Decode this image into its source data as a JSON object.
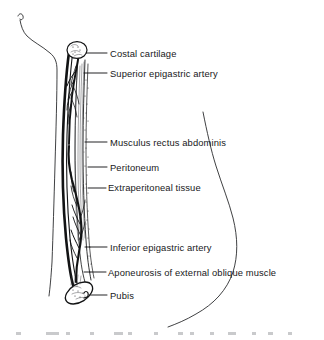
{
  "figure": {
    "kind": "anatomical-illustration",
    "orientation": "left body contour at left, abdominal profile contour at right",
    "background_color": "#ffffff",
    "ink_color": "#17181a"
  },
  "labels": [
    {
      "id": "costal-cartilage",
      "text": "Costal cartilage",
      "text_x": 110,
      "text_y": 57,
      "leader_from_x": 86,
      "leader_from_y": 53,
      "leader_to_x": 107,
      "leader_to_y": 53
    },
    {
      "id": "superior-epigastric-artery",
      "text": "Superior epigastric artery",
      "text_x": 110,
      "text_y": 77,
      "leader_from_x": 84,
      "leader_from_y": 73,
      "leader_to_x": 107,
      "leader_to_y": 73
    },
    {
      "id": "musculus-rectus-abdominis",
      "text": "Musculus rectus abdominis",
      "text_x": 110,
      "text_y": 146,
      "leader_from_x": 85,
      "leader_from_y": 142,
      "leader_to_x": 107,
      "leader_to_y": 142
    },
    {
      "id": "peritoneum",
      "text": "Peritoneum",
      "text_x": 110,
      "text_y": 171,
      "leader_from_x": 88,
      "leader_from_y": 167,
      "leader_to_x": 107,
      "leader_to_y": 167
    },
    {
      "id": "extraperitoneal-tissue",
      "text": "Extraperitoneal tissue",
      "text_x": 108,
      "text_y": 191,
      "leader_from_x": 88,
      "leader_from_y": 188,
      "leader_to_x": 106,
      "leader_to_y": 188
    },
    {
      "id": "inferior-epigastric-artery",
      "text": "Inferior epigastric artery",
      "text_x": 110,
      "text_y": 251,
      "leader_from_x": 85,
      "leader_from_y": 247,
      "leader_to_x": 107,
      "leader_to_y": 247
    },
    {
      "id": "aponeurosis-of-external-oblique-muscle",
      "text": "Aponeurosis of external oblique muscle",
      "text_x": 108,
      "text_y": 276,
      "leader_from_x": 84,
      "leader_from_y": 272,
      "leader_to_x": 106,
      "leader_to_y": 272
    },
    {
      "id": "pubis",
      "text": "Pubis",
      "text_x": 110,
      "text_y": 299,
      "leader_from_x": 90,
      "leader_from_y": 295,
      "leader_to_x": 107,
      "leader_to_y": 295
    }
  ],
  "structures": [
    {
      "id": "costal-cartilage-section",
      "shape": "ellipse",
      "cx": 77,
      "cy": 50,
      "rx": 10,
      "ry": 8
    },
    {
      "id": "pubis-section",
      "shape": "ellipse",
      "cx": 79,
      "cy": 293,
      "rx": 15,
      "ry": 9,
      "rotation": -32
    },
    {
      "id": "rectus-abdominis-band",
      "shape": "striated-column"
    },
    {
      "id": "superior-epigastric-artery-vessel",
      "shape": "descending-branching-vessel"
    },
    {
      "id": "inferior-epigastric-artery-vessel",
      "shape": "ascending-branching-vessel"
    },
    {
      "id": "peritoneum-line",
      "shape": "thin-inner-line"
    },
    {
      "id": "extraperitoneal-tissue-layer",
      "shape": "stippled-layer"
    },
    {
      "id": "external-oblique-aponeurosis-line",
      "shape": "thick-outer-line"
    },
    {
      "id": "left-body-contour",
      "shape": "open-curve"
    },
    {
      "id": "right-abdominal-contour",
      "shape": "open-curve"
    }
  ]
}
